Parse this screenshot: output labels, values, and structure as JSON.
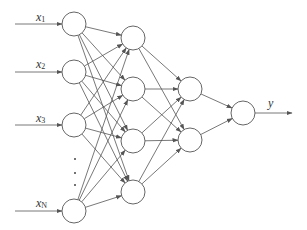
{
  "diagram": {
    "type": "feedforward-neural-network",
    "colors": {
      "stroke": "#555555",
      "background": "#ffffff",
      "text": "#333333"
    },
    "node_radius": 12,
    "layers": [
      {
        "name": "input",
        "x": 74,
        "nodes": [
          24,
          72,
          125,
          211
        ]
      },
      {
        "name": "hidden1",
        "x": 133,
        "nodes": [
          38,
          89,
          141,
          192
        ]
      },
      {
        "name": "hidden2",
        "x": 190,
        "nodes": [
          89,
          140
        ]
      },
      {
        "name": "output",
        "x": 243,
        "nodes": [
          113
        ]
      }
    ],
    "inputs": [
      {
        "base": "x",
        "sub": "1",
        "label_x": 36,
        "label_y": 11,
        "y": 24
      },
      {
        "base": "x",
        "sub": "2",
        "label_x": 36,
        "label_y": 58,
        "y": 72
      },
      {
        "base": "x",
        "sub": "3",
        "label_x": 36,
        "label_y": 112,
        "y": 125
      },
      {
        "base": "x",
        "sub": "N",
        "label_x": 36,
        "label_y": 197,
        "y": 211
      }
    ],
    "output": {
      "label": "y",
      "label_x": 268,
      "label_y": 97,
      "arrow_end_x": 292
    },
    "ellipsis_dots": [
      158,
      172,
      184
    ]
  }
}
